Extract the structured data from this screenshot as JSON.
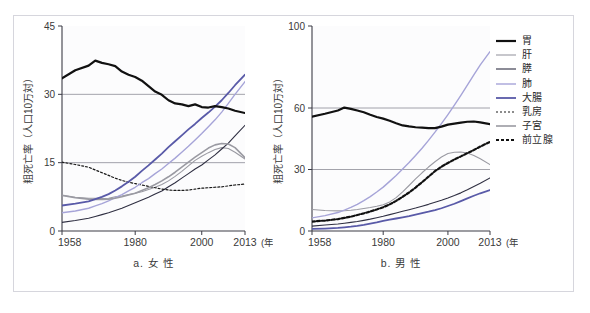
{
  "figure": {
    "ylabel": "粗死亡率（人口10万対）",
    "xunit": "(年)",
    "legend": {
      "position": "right",
      "items": [
        {
          "label": "胃",
          "color": "#111111",
          "width": 2.2,
          "dash": "none"
        },
        {
          "label": "肝",
          "color": "#9a9aa2",
          "width": 1.1,
          "dash": "none"
        },
        {
          "label": "膵",
          "color": "#2f2f42",
          "width": 1.1,
          "dash": "none"
        },
        {
          "label": "肺",
          "color": "#a6a4d8",
          "width": 1.4,
          "dash": "none"
        },
        {
          "label": "大腸",
          "color": "#595aa8",
          "width": 1.8,
          "dash": "none"
        },
        {
          "label": "乳房",
          "color": "#1a1a1a",
          "width": 1.2,
          "dash": "2,2"
        },
        {
          "label": "子宮",
          "color": "#9a9aa2",
          "width": 1.6,
          "dash": "none"
        },
        {
          "label": "前立腺",
          "color": "#111111",
          "width": 2.2,
          "dash": "3,2"
        }
      ]
    }
  },
  "chart_data": [
    {
      "type": "line",
      "id": "female",
      "title": "a. 女 性",
      "xlabel": "(年)",
      "ylabel": "粗死亡率（人口10万対）",
      "xlim": [
        1958,
        2013
      ],
      "ylim": [
        0,
        45
      ],
      "yticks": [
        0,
        15,
        30,
        45
      ],
      "xticks": [
        1958,
        1980,
        2000,
        2013
      ],
      "grid": "horizontal-at-15-30",
      "x": [
        1958,
        1962,
        1966,
        1968,
        1970,
        1972,
        1974,
        1976,
        1978,
        1980,
        1982,
        1984,
        1986,
        1988,
        1990,
        1992,
        1994,
        1996,
        1998,
        2000,
        2002,
        2004,
        2006,
        2008,
        2010,
        2013
      ],
      "series": [
        {
          "name": "胃",
          "values": [
            33.5,
            35.3,
            36.3,
            37.4,
            36.9,
            36.6,
            36.2,
            35.0,
            34.3,
            33.8,
            33.0,
            31.8,
            30.6,
            29.9,
            28.7,
            28.0,
            27.8,
            27.4,
            27.8,
            27.2,
            27.1,
            27.4,
            27.2,
            26.9,
            26.4,
            25.9
          ]
        },
        {
          "name": "肝",
          "values": [
            7.9,
            7.4,
            7.2,
            7.2,
            7.1,
            7.2,
            7.5,
            7.7,
            8.0,
            8.3,
            8.6,
            9.1,
            9.6,
            10.2,
            11.0,
            12.0,
            13.1,
            14.3,
            15.5,
            16.4,
            17.2,
            17.9,
            18.3,
            18.1,
            17.3,
            15.8
          ]
        },
        {
          "name": "膵",
          "values": [
            1.9,
            2.3,
            2.8,
            3.2,
            3.6,
            4.0,
            4.5,
            5.0,
            5.6,
            6.2,
            6.8,
            7.4,
            8.1,
            8.8,
            9.7,
            10.6,
            11.6,
            12.6,
            13.6,
            14.5,
            15.6,
            16.7,
            18.0,
            19.3,
            20.9,
            23.2
          ]
        },
        {
          "name": "肺",
          "values": [
            4.0,
            4.4,
            5.0,
            5.5,
            6.0,
            6.6,
            7.3,
            8.0,
            8.8,
            9.6,
            10.6,
            11.5,
            12.6,
            13.6,
            14.8,
            16.0,
            17.3,
            18.6,
            20.0,
            21.4,
            22.9,
            24.4,
            26.1,
            28.0,
            30.0,
            32.8
          ]
        },
        {
          "name": "大腸",
          "values": [
            5.6,
            6.0,
            6.5,
            7.0,
            7.5,
            8.1,
            8.9,
            9.8,
            10.8,
            11.9,
            13.2,
            14.4,
            15.7,
            17.0,
            18.4,
            19.7,
            21.0,
            22.3,
            23.5,
            24.8,
            26.0,
            27.3,
            28.7,
            30.3,
            32.0,
            34.3
          ]
        },
        {
          "name": "乳房",
          "values": [
            15.1,
            14.6,
            14.0,
            13.4,
            12.8,
            12.2,
            11.6,
            11.1,
            10.7,
            10.4,
            10.1,
            9.8,
            9.5,
            9.2,
            9.0,
            8.9,
            8.9,
            9.0,
            9.2,
            9.4,
            9.5,
            9.6,
            9.7,
            9.9,
            10.1,
            10.3
          ]
        },
        {
          "name": "子宮",
          "values": [
            7.8,
            7.3,
            7.0,
            6.9,
            6.9,
            7.0,
            7.2,
            7.5,
            7.9,
            8.3,
            8.9,
            9.5,
            10.2,
            11.0,
            11.9,
            12.9,
            14.0,
            15.1,
            16.2,
            17.2,
            18.2,
            18.9,
            19.2,
            19.1,
            18.3,
            16.1
          ]
        }
      ]
    },
    {
      "type": "line",
      "id": "male",
      "title": "b. 男 性",
      "xlabel": "(年)",
      "ylabel": "粗死亡率（人口10万対）",
      "xlim": [
        1958,
        2013
      ],
      "ylim": [
        0,
        100
      ],
      "yticks": [
        0,
        30,
        60,
        100
      ],
      "xticks": [
        1958,
        1980,
        2000,
        2013
      ],
      "grid": "horizontal-at-30-60",
      "x": [
        1958,
        1962,
        1966,
        1968,
        1970,
        1972,
        1974,
        1976,
        1978,
        1980,
        1982,
        1984,
        1986,
        1988,
        1990,
        1992,
        1994,
        1996,
        1998,
        2000,
        2002,
        2004,
        2006,
        2008,
        2010,
        2013
      ],
      "series": [
        {
          "name": "胃",
          "values": [
            55.8,
            57.2,
            58.8,
            60.2,
            59.6,
            58.8,
            57.9,
            56.7,
            55.6,
            54.8,
            53.8,
            52.6,
            51.5,
            51.0,
            50.6,
            50.4,
            50.2,
            50.2,
            50.9,
            51.9,
            52.4,
            52.9,
            53.3,
            53.4,
            53.0,
            52.1
          ]
        },
        {
          "name": "肝",
          "values": [
            10.5,
            10.0,
            9.8,
            9.9,
            10.1,
            10.5,
            11.0,
            11.5,
            12.1,
            12.8,
            14.2,
            16.3,
            19.1,
            22.2,
            25.4,
            28.4,
            31.2,
            33.8,
            36.1,
            37.8,
            38.4,
            38.5,
            38.0,
            36.8,
            35.2,
            32.4
          ]
        },
        {
          "name": "膵",
          "values": [
            2.4,
            2.9,
            3.4,
            3.8,
            4.2,
            4.6,
            5.2,
            5.8,
            6.5,
            7.2,
            8.0,
            8.8,
            9.6,
            10.4,
            11.2,
            12.1,
            13.0,
            14.0,
            15.0,
            16.1,
            17.3,
            18.6,
            20.1,
            21.7,
            23.3,
            25.9
          ]
        },
        {
          "name": "肺",
          "values": [
            6.4,
            7.5,
            9.0,
            10.2,
            11.5,
            13.0,
            14.8,
            16.8,
            19.0,
            21.4,
            24.2,
            27.1,
            30.2,
            33.4,
            36.8,
            40.4,
            44.2,
            48.2,
            52.4,
            56.8,
            61.4,
            66.2,
            71.2,
            76.2,
            81.0,
            87.5
          ]
        },
        {
          "name": "大腸",
          "values": [
            1.0,
            1.2,
            1.5,
            1.8,
            2.1,
            2.5,
            3.0,
            3.6,
            4.2,
            4.9,
            5.5,
            6.1,
            6.7,
            7.3,
            8.0,
            8.7,
            9.4,
            10.2,
            11.1,
            12.2,
            13.3,
            14.6,
            15.9,
            17.2,
            18.4,
            20.0
          ]
        },
        {
          "name": "前立腺",
          "values": [
            4.6,
            5.1,
            5.8,
            6.4,
            7.0,
            7.8,
            8.6,
            9.5,
            10.5,
            11.6,
            13.0,
            14.7,
            16.7,
            18.8,
            21.2,
            23.8,
            26.5,
            29.2,
            31.4,
            33.2,
            34.9,
            36.4,
            38.0,
            39.5,
            41.2,
            43.5
          ]
        }
      ]
    }
  ]
}
